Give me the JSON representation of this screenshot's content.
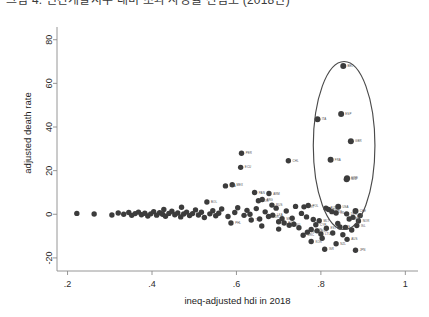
{
  "caption": {
    "text": "그림 4. 인간개발지수 대비 초과 사망률 산점도 (2018년)"
  },
  "chart_data": {
    "type": "scatter",
    "title": "",
    "xlabel": "ineq-adjusted hdi in 2018",
    "ylabel": "adjusted death rate",
    "xlim": [
      0.175,
      1.03
    ],
    "ylim": [
      -26,
      84
    ],
    "xticks": [
      0.2,
      0.4,
      0.6,
      0.8,
      1.0
    ],
    "xticklabels": [
      ".2",
      ".4",
      ".6",
      ".8",
      "1"
    ],
    "yticks": [
      -20,
      0,
      20,
      40,
      60,
      80
    ],
    "yticklabels": [
      "-20",
      "0",
      "20",
      "40",
      "60",
      "80"
    ],
    "grid": false,
    "legend": false,
    "marker_color": "#3c3c3c",
    "annotation_color": "#4a4a4a",
    "annotations": [
      {
        "kind": "ellipse",
        "name": "outlier-highlight-ellipse",
        "cx": 0.855,
        "cy": 31.5,
        "rx": 0.073,
        "ry": 38.5
      }
    ],
    "points": [
      {
        "label": "BEL",
        "x": 0.853,
        "y": 68.0,
        "highlighted": true
      },
      {
        "label": "ESP",
        "x": 0.848,
        "y": 46.0,
        "highlighted": true
      },
      {
        "label": "ITA",
        "x": 0.792,
        "y": 43.5,
        "highlighted": true
      },
      {
        "label": "GBR",
        "x": 0.871,
        "y": 33.5,
        "highlighted": true
      },
      {
        "label": "FRA",
        "x": 0.823,
        "y": 25.0,
        "highlighted": true
      },
      {
        "label": "SWE",
        "x": 0.862,
        "y": 16.5,
        "highlighted": true
      },
      {
        "label": "NLD",
        "x": 0.861,
        "y": 16.0,
        "highlighted": true
      },
      {
        "label": "USA",
        "x": 0.841,
        "y": 3.5,
        "highlighted": true
      },
      {
        "label": "CHE",
        "x": 0.882,
        "y": 1.5,
        "highlighted": true
      },
      {
        "label": "PER",
        "x": 0.612,
        "y": 28.0,
        "highlighted": false
      },
      {
        "label": "CHL",
        "x": 0.723,
        "y": 24.5,
        "highlighted": false
      },
      {
        "label": "ECU",
        "x": 0.61,
        "y": 21.5,
        "highlighted": false
      },
      {
        "label": "MEX",
        "x": 0.59,
        "y": 13.5,
        "highlighted": false
      },
      {
        "label": "BRA",
        "x": 0.574,
        "y": 13.0,
        "highlighted": false
      },
      {
        "label": "PAN",
        "x": 0.643,
        "y": 10.0,
        "highlighted": false
      },
      {
        "label": "ARM",
        "x": 0.677,
        "y": 9.5,
        "highlighted": false
      },
      {
        "label": "ARG",
        "x": 0.661,
        "y": 6.8,
        "highlighted": false
      },
      {
        "label": "COL",
        "x": 0.652,
        "y": 6.2,
        "highlighted": false
      },
      {
        "label": "BOL",
        "x": 0.53,
        "y": 5.6,
        "highlighted": false
      },
      {
        "label": "RUS",
        "x": 0.684,
        "y": 4.2,
        "highlighted": false
      },
      {
        "label": "POL",
        "x": 0.77,
        "y": 4.0,
        "highlighted": false
      },
      {
        "label": "PRT",
        "x": 0.76,
        "y": 3.4,
        "highlighted": false
      },
      {
        "label": "AUT",
        "x": 0.812,
        "y": 2.8,
        "highlighted": false
      },
      {
        "label": "SVN",
        "x": 0.818,
        "y": 2.2,
        "highlighted": false
      },
      {
        "label": "LUX",
        "x": 0.826,
        "y": 1.2,
        "highlighted": false
      },
      {
        "label": "IRL",
        "x": 0.836,
        "y": 0.6,
        "highlighted": false
      },
      {
        "label": "DEU",
        "x": 0.861,
        "y": 0.2,
        "highlighted": false
      },
      {
        "label": "FIN",
        "x": 0.876,
        "y": -1.4,
        "highlighted": false
      },
      {
        "label": "DNK",
        "x": 0.867,
        "y": -2.2,
        "highlighted": false
      },
      {
        "label": "NOR",
        "x": 0.889,
        "y": -3.1,
        "highlighted": false
      },
      {
        "label": "ISL",
        "x": 0.885,
        "y": -5.2,
        "highlighted": false
      },
      {
        "label": "CZE",
        "x": 0.845,
        "y": -5.8,
        "highlighted": false
      },
      {
        "label": "EST",
        "x": 0.813,
        "y": -6.4,
        "highlighted": false
      },
      {
        "label": "HUN",
        "x": 0.777,
        "y": -7.0,
        "highlighted": false
      },
      {
        "label": "SVK",
        "x": 0.791,
        "y": -7.6,
        "highlighted": false
      },
      {
        "label": "HRV",
        "x": 0.768,
        "y": -8.2,
        "highlighted": false
      },
      {
        "label": "LTU",
        "x": 0.8,
        "y": -9.0,
        "highlighted": false
      },
      {
        "label": "AUS",
        "x": 0.862,
        "y": -11.5,
        "highlighted": false
      },
      {
        "label": "JPN",
        "x": 0.882,
        "y": -16.5,
        "highlighted": false
      },
      {
        "label": "ISR",
        "x": 0.809,
        "y": -16.0,
        "highlighted": false
      },
      {
        "label": "KOR",
        "x": 0.777,
        "y": -12.5,
        "highlighted": false
      },
      {
        "label": "NZL",
        "x": 0.836,
        "y": -13.5,
        "highlighted": false
      },
      {
        "label": "GRC",
        "x": 0.758,
        "y": -9.6,
        "highlighted": false
      },
      {
        "label": "CYP",
        "x": 0.788,
        "y": -4.8,
        "highlighted": false
      },
      {
        "label": "MLT",
        "x": 0.796,
        "y": -3.0,
        "highlighted": false
      },
      {
        "label": "BGR",
        "x": 0.713,
        "y": -4.0,
        "highlighted": false
      },
      {
        "label": "ROU",
        "x": 0.725,
        "y": -5.0,
        "highlighted": false
      },
      {
        "label": "SRB",
        "x": 0.708,
        "y": -2.0,
        "highlighted": false
      },
      {
        "label": "TUR",
        "x": 0.676,
        "y": -1.0,
        "highlighted": false
      },
      {
        "label": "THA",
        "x": 0.635,
        "y": -2.6,
        "highlighted": false
      },
      {
        "label": "LKA",
        "x": 0.686,
        "y": -0.4,
        "highlighted": false
      },
      {
        "label": "PHL",
        "x": 0.587,
        "y": -4.0,
        "highlighted": false
      },
      {
        "label": "",
        "x": 0.222,
        "y": 0.4,
        "highlighted": false
      },
      {
        "label": "",
        "x": 0.263,
        "y": 0.1,
        "highlighted": false
      },
      {
        "label": "",
        "x": 0.305,
        "y": -0.3,
        "highlighted": false
      },
      {
        "label": "",
        "x": 0.32,
        "y": 0.6,
        "highlighted": false
      },
      {
        "label": "",
        "x": 0.333,
        "y": 0.0,
        "highlighted": false
      },
      {
        "label": "",
        "x": 0.345,
        "y": 0.8,
        "highlighted": false
      },
      {
        "label": "",
        "x": 0.352,
        "y": -0.5,
        "highlighted": false
      },
      {
        "label": "",
        "x": 0.36,
        "y": 0.3,
        "highlighted": false
      },
      {
        "label": "",
        "x": 0.368,
        "y": 1.0,
        "highlighted": false
      },
      {
        "label": "",
        "x": 0.375,
        "y": -0.2,
        "highlighted": false
      },
      {
        "label": "",
        "x": 0.383,
        "y": 0.5,
        "highlighted": false
      },
      {
        "label": "",
        "x": 0.39,
        "y": -0.8,
        "highlighted": false
      },
      {
        "label": "",
        "x": 0.397,
        "y": 0.2,
        "highlighted": false
      },
      {
        "label": "",
        "x": 0.404,
        "y": 1.2,
        "highlighted": false
      },
      {
        "label": "",
        "x": 0.411,
        "y": -0.4,
        "highlighted": false
      },
      {
        "label": "",
        "x": 0.418,
        "y": 0.7,
        "highlighted": false
      },
      {
        "label": "",
        "x": 0.425,
        "y": 0.0,
        "highlighted": false
      },
      {
        "label": "",
        "x": 0.432,
        "y": -0.9,
        "highlighted": false
      },
      {
        "label": "",
        "x": 0.44,
        "y": 0.4,
        "highlighted": false
      },
      {
        "label": "",
        "x": 0.447,
        "y": 1.4,
        "highlighted": false
      },
      {
        "label": "",
        "x": 0.454,
        "y": -0.2,
        "highlighted": false
      },
      {
        "label": "",
        "x": 0.461,
        "y": 0.6,
        "highlighted": false
      },
      {
        "label": "",
        "x": 0.468,
        "y": -1.2,
        "highlighted": false
      },
      {
        "label": "",
        "x": 0.475,
        "y": 0.1,
        "highlighted": false
      },
      {
        "label": "",
        "x": 0.482,
        "y": 1.0,
        "highlighted": false
      },
      {
        "label": "",
        "x": 0.489,
        "y": -0.6,
        "highlighted": false
      },
      {
        "label": "",
        "x": 0.496,
        "y": 0.3,
        "highlighted": false
      },
      {
        "label": "",
        "x": 0.503,
        "y": 2.0,
        "highlighted": false
      },
      {
        "label": "",
        "x": 0.51,
        "y": -0.3,
        "highlighted": false
      },
      {
        "label": "",
        "x": 0.517,
        "y": 0.9,
        "highlighted": false
      },
      {
        "label": "",
        "x": 0.524,
        "y": -1.5,
        "highlighted": false
      },
      {
        "label": "",
        "x": 0.537,
        "y": 0.2,
        "highlighted": false
      },
      {
        "label": "",
        "x": 0.544,
        "y": 1.6,
        "highlighted": false
      },
      {
        "label": "",
        "x": 0.551,
        "y": -0.7,
        "highlighted": false
      },
      {
        "label": "",
        "x": 0.558,
        "y": 0.5,
        "highlighted": false
      },
      {
        "label": "",
        "x": 0.565,
        "y": 2.4,
        "highlighted": false
      },
      {
        "label": "",
        "x": 0.58,
        "y": -1.0,
        "highlighted": false
      },
      {
        "label": "",
        "x": 0.596,
        "y": 0.8,
        "highlighted": false
      },
      {
        "label": "",
        "x": 0.603,
        "y": 3.0,
        "highlighted": false
      },
      {
        "label": "",
        "x": 0.618,
        "y": -0.5,
        "highlighted": false
      },
      {
        "label": "",
        "x": 0.625,
        "y": 1.8,
        "highlighted": false
      },
      {
        "label": "",
        "x": 0.632,
        "y": 0.0,
        "highlighted": false
      },
      {
        "label": "",
        "x": 0.647,
        "y": 2.6,
        "highlighted": false
      },
      {
        "label": "",
        "x": 0.655,
        "y": -2.2,
        "highlighted": false
      },
      {
        "label": "",
        "x": 0.668,
        "y": 1.1,
        "highlighted": false
      },
      {
        "label": "",
        "x": 0.694,
        "y": 2.8,
        "highlighted": false
      },
      {
        "label": "",
        "x": 0.7,
        "y": -3.4,
        "highlighted": false
      },
      {
        "label": "",
        "x": 0.718,
        "y": 1.5,
        "highlighted": false
      },
      {
        "label": "",
        "x": 0.732,
        "y": -1.8,
        "highlighted": false
      },
      {
        "label": "",
        "x": 0.74,
        "y": 3.6,
        "highlighted": false
      },
      {
        "label": "",
        "x": 0.748,
        "y": -6.2,
        "highlighted": false
      },
      {
        "label": "",
        "x": 0.754,
        "y": 0.4,
        "highlighted": false
      },
      {
        "label": "",
        "x": 0.782,
        "y": -2.4,
        "highlighted": false
      },
      {
        "label": "",
        "x": 0.803,
        "y": -11.0,
        "highlighted": false
      },
      {
        "label": "",
        "x": 0.828,
        "y": -8.6,
        "highlighted": false
      },
      {
        "label": "",
        "x": 0.852,
        "y": -9.4,
        "highlighted": false
      },
      {
        "label": "",
        "x": 0.873,
        "y": -7.2,
        "highlighted": false
      },
      {
        "label": "",
        "x": 0.893,
        "y": -0.6,
        "highlighted": false
      },
      {
        "label": "",
        "x": 0.428,
        "y": 2.2,
        "highlighted": false
      },
      {
        "label": "",
        "x": 0.47,
        "y": 3.2,
        "highlighted": false
      },
      {
        "label": "",
        "x": 0.66,
        "y": -5.4,
        "highlighted": false
      },
      {
        "label": "",
        "x": 0.7,
        "y": -6.8,
        "highlighted": false
      },
      {
        "label": "",
        "x": 0.736,
        "y": -4.6,
        "highlighted": false
      },
      {
        "label": "",
        "x": 0.766,
        "y": -1.2,
        "highlighted": false
      },
      {
        "label": "",
        "x": 0.84,
        "y": -4.2,
        "highlighted": false
      },
      {
        "label": "",
        "x": 0.858,
        "y": -6.0,
        "highlighted": false
      }
    ]
  }
}
